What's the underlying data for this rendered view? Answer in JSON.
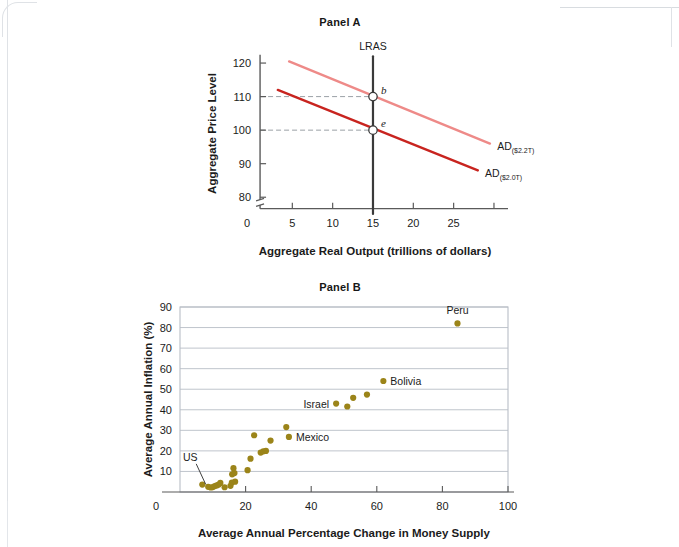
{
  "figure": {
    "panel_a_title": "Panel A",
    "panel_b_title": "Panel B"
  },
  "colors": {
    "ad_initial": "#c8241f",
    "ad_shifted": "#ee8a88",
    "lras": "#3a3a3a",
    "dot": "#9b8419",
    "grid": "#b8bec6",
    "axis": "#5a5a5a",
    "dashed": "#9aa0a6",
    "page": "#ffffff"
  },
  "chart_data": [
    {
      "type": "line",
      "title": "Panel A",
      "xlabel": "Aggregate Real Output (trillions of dollars)",
      "ylabel": "Aggregate Price Level",
      "xlim": [
        0,
        30
      ],
      "ylim": [
        75,
        123
      ],
      "xticks": [
        0,
        5,
        10,
        15,
        20,
        25
      ],
      "yticks": [
        80,
        90,
        100,
        110,
        120
      ],
      "y_axis_break": true,
      "grid": false,
      "series": [
        {
          "name": "AD",
          "label": "AD",
          "sublabel": "($2.0T)",
          "color": "#c8241f",
          "x": [
            3.2,
            28.0
          ],
          "y": [
            112.0,
            88.0
          ]
        },
        {
          "name": "AD shifted",
          "label": "AD",
          "sublabel": "($2.2T)",
          "color": "#ee8a88",
          "x": [
            4.6,
            29.5
          ],
          "y": [
            120.5,
            96.0
          ]
        },
        {
          "name": "LRAS",
          "label": "LRAS",
          "color": "#3a3a3a",
          "x": [
            15,
            15
          ],
          "y": [
            122,
            75
          ]
        }
      ],
      "annotations": [
        {
          "label": "b",
          "x": 15,
          "y": 110,
          "marker": "open-circle"
        },
        {
          "label": "e",
          "x": 15,
          "y": 100,
          "marker": "open-circle"
        }
      ],
      "dashed_guides": [
        {
          "from_y": 110,
          "to_x": 15
        },
        {
          "from_y": 100,
          "to_x": 15
        }
      ]
    },
    {
      "type": "scatter",
      "title": "Panel B",
      "xlabel": "Average Annual Percentage Change in Money Supply",
      "ylabel": "Average Annual Inflation (%)",
      "xlim": [
        0,
        100
      ],
      "ylim": [
        0,
        90
      ],
      "xticks": [
        0,
        20,
        40,
        60,
        80,
        100
      ],
      "yticks": [
        10,
        20,
        30,
        40,
        50,
        60,
        70,
        80,
        90
      ],
      "grid": true,
      "grid_orientation": "horizontal",
      "marker_color": "#9b8419",
      "points": [
        {
          "x": 6.8,
          "y": 3.6
        },
        {
          "x": 8.6,
          "y": 2.5,
          "label": "US",
          "label_pos": "callout"
        },
        {
          "x": 9.4,
          "y": 2.2
        },
        {
          "x": 10.0,
          "y": 2.4
        },
        {
          "x": 10.6,
          "y": 2.9
        },
        {
          "x": 11.2,
          "y": 3.2
        },
        {
          "x": 11.8,
          "y": 3.6
        },
        {
          "x": 12.3,
          "y": 4.4
        },
        {
          "x": 13.6,
          "y": 2.3
        },
        {
          "x": 15.4,
          "y": 3.0
        },
        {
          "x": 15.8,
          "y": 4.6
        },
        {
          "x": 15.9,
          "y": 8.6
        },
        {
          "x": 16.3,
          "y": 11.6
        },
        {
          "x": 16.6,
          "y": 9.2
        },
        {
          "x": 16.8,
          "y": 5.0
        },
        {
          "x": 20.6,
          "y": 10.6
        },
        {
          "x": 21.5,
          "y": 16.2
        },
        {
          "x": 22.6,
          "y": 27.6
        },
        {
          "x": 24.6,
          "y": 19.2
        },
        {
          "x": 25.4,
          "y": 19.8
        },
        {
          "x": 26.2,
          "y": 20.0
        },
        {
          "x": 27.6,
          "y": 25.0
        },
        {
          "x": 32.4,
          "y": 31.6
        },
        {
          "x": 33.2,
          "y": 26.8,
          "label": "Mexico",
          "label_pos": "right"
        },
        {
          "x": 47.6,
          "y": 43.0,
          "label": "Israel",
          "label_pos": "left"
        },
        {
          "x": 51.0,
          "y": 41.6
        },
        {
          "x": 52.8,
          "y": 45.8
        },
        {
          "x": 57.0,
          "y": 47.4
        },
        {
          "x": 62.0,
          "y": 54.0,
          "label": "Bolivia",
          "label_pos": "right"
        },
        {
          "x": 84.6,
          "y": 82.0,
          "label": "Peru",
          "label_pos": "above"
        }
      ]
    }
  ]
}
